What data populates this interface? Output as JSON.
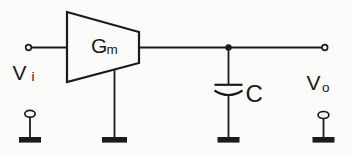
{
  "schematic": {
    "kind": "circuit-schematic",
    "colors": {
      "background": "#fbfbf9",
      "ink": "#1b1b1b"
    },
    "labels": {
      "input": {
        "base": "V",
        "sub": "i"
      },
      "amplifier": {
        "base": "G",
        "sub": "m"
      },
      "capacitor": "C",
      "output": {
        "base": "V",
        "sub": "o"
      }
    },
    "components": [
      {
        "name": "input-terminal",
        "symbol": "open-circle"
      },
      {
        "name": "transconductance-amplifier",
        "symbol": "trapezoid",
        "label": "Gm"
      },
      {
        "name": "capacitor",
        "symbol": "straight-plate-over-curved-plate",
        "label": "C"
      },
      {
        "name": "output-terminal",
        "symbol": "open-circle"
      },
      {
        "name": "ground",
        "symbol": "solid-bar",
        "count": 4
      }
    ]
  }
}
